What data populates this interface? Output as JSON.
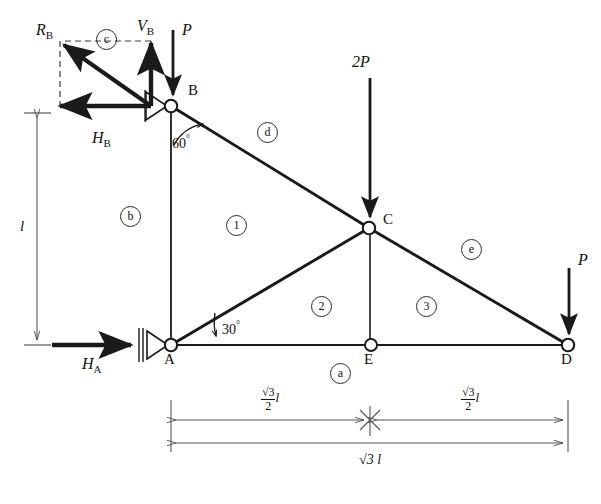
{
  "figure": {
    "type": "statics-truss-free-body-diagram",
    "nodes": [
      {
        "id": "A",
        "label": "A",
        "x": 171,
        "y": 345,
        "support": "roller-pin",
        "label_x": 164,
        "label_y": 352
      },
      {
        "id": "B",
        "label": "B",
        "x": 171,
        "y": 106,
        "support": "pin",
        "label_x": 188,
        "label_y": 90
      },
      {
        "id": "C",
        "label": "C",
        "x": 369,
        "y": 228,
        "support": "none",
        "label_x": 383,
        "label_y": 214
      },
      {
        "id": "D",
        "label": "D",
        "x": 568,
        "y": 345,
        "support": "none",
        "label_x": 561,
        "label_y": 352
      },
      {
        "id": "E",
        "label": "E",
        "x": 371,
        "y": 345,
        "support": "none",
        "label_x": 364,
        "label_y": 352
      }
    ],
    "members": [
      {
        "id": "a",
        "label": "a",
        "from": "A",
        "to": "D",
        "kind": "bottom-chord"
      },
      {
        "id": "b",
        "label": "b",
        "from": "A",
        "to": "B",
        "kind": "vertical-left"
      },
      {
        "id": "d",
        "label": "d",
        "from": "B",
        "to": "C",
        "kind": "top-chord"
      },
      {
        "id": "e",
        "label": "e",
        "from": "C",
        "to": "D",
        "kind": "top-chord"
      }
    ],
    "member_labels": [
      {
        "label": "a",
        "x": 330,
        "y": 363
      },
      {
        "label": "b",
        "x": 129,
        "y": 215
      },
      {
        "label": "c",
        "x": 105,
        "y": 38
      },
      {
        "label": "d",
        "x": 257,
        "y": 122
      },
      {
        "label": "e",
        "x": 461,
        "y": 239
      }
    ],
    "panel_labels": [
      {
        "label": "1",
        "x": 226,
        "y": 215
      },
      {
        "label": "2",
        "x": 311,
        "y": 296
      },
      {
        "label": "3",
        "x": 416,
        "y": 296
      }
    ],
    "loads": [
      {
        "name": "P-at-B",
        "label": "P",
        "x": 173,
        "y_start": 30,
        "y_end": 100,
        "label_x": 182,
        "label_y": 28
      },
      {
        "name": "2P-at-C",
        "label": "2P",
        "x": 370,
        "y_start": 78,
        "y_end": 222,
        "label_x": 356,
        "label_y": 60
      },
      {
        "name": "P-at-D",
        "label": "P",
        "x": 569,
        "y_start": 268,
        "y_end": 339,
        "label_x": 578,
        "label_y": 258
      }
    ],
    "reactions": [
      {
        "name": "H_A",
        "base": "H",
        "sub": "A",
        "label_x": 85,
        "label_y": 360
      },
      {
        "name": "H_B",
        "base": "H",
        "sub": "B",
        "label_x": 94,
        "label_y": 136
      },
      {
        "name": "V_B",
        "base": "V",
        "sub": "B",
        "label_x": 140,
        "label_y": 25
      },
      {
        "name": "R_B",
        "base": "R",
        "sub": "B",
        "label_x": 39,
        "label_y": 28
      }
    ],
    "angles": [
      {
        "label": "60",
        "unit": "°",
        "at_node": "B",
        "x": 178,
        "y": 138
      },
      {
        "label": "30",
        "unit": "°",
        "at_node": "A",
        "x": 222,
        "y": 326
      }
    ],
    "dimensions": [
      {
        "name": "height-l",
        "text": "l",
        "orientation": "vertical",
        "x": 26,
        "y": 225
      },
      {
        "name": "span-left",
        "num": "√3",
        "den": "2",
        "suffix": "l",
        "orientation": "horizontal",
        "x": 268,
        "y": 398
      },
      {
        "name": "span-right",
        "num": "√3",
        "den": "2",
        "suffix": "l",
        "orientation": "horizontal",
        "x": 468,
        "y": 398
      },
      {
        "name": "span-total",
        "text": "√3 l",
        "orientation": "horizontal",
        "x": 368,
        "y": 473
      }
    ],
    "colors": {
      "line": "#1a1a1a",
      "thin_line": "#555555",
      "background": "#ffffff",
      "text": "#111111"
    }
  }
}
